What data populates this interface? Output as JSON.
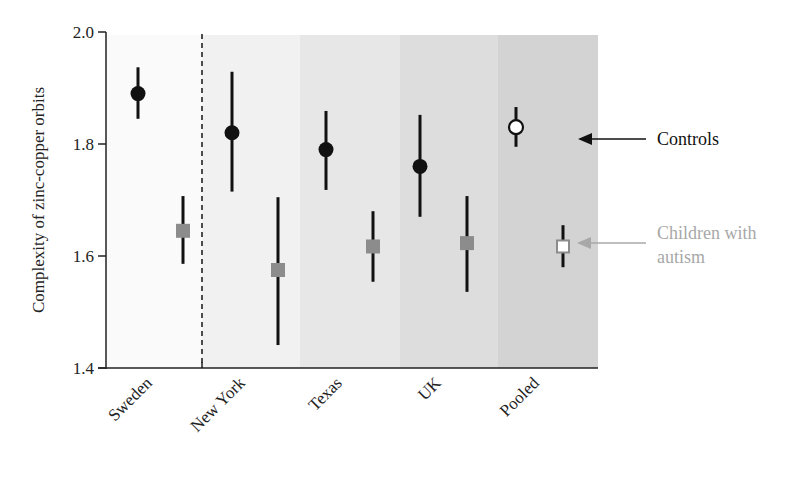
{
  "chart_data": {
    "type": "scatter",
    "subtype": "point-with-error-bars",
    "title": "",
    "xlabel": "",
    "ylabel": "Complexity of zinc-copper orbits",
    "ylim": [
      1.4,
      2.0
    ],
    "yticks": [
      "1.4",
      "1.6",
      "1.8",
      "2.0"
    ],
    "categories": [
      "Sweden",
      "New York",
      "Texas",
      "UK",
      "Pooled"
    ],
    "band_colors": [
      "#fafafa",
      "#f1f1f1",
      "#e7e7e7",
      "#dddddd",
      "#d3d3d3"
    ],
    "separator": {
      "after": "Sweden",
      "style": "dashed"
    },
    "series": [
      {
        "name": "Controls",
        "marker": "circle",
        "color": "#111111",
        "pooled_marker": "open-circle",
        "values": [
          1.89,
          1.82,
          1.79,
          1.76,
          1.83
        ],
        "lower": [
          1.845,
          1.715,
          1.718,
          1.67,
          1.795
        ],
        "upper": [
          1.937,
          1.929,
          1.859,
          1.852,
          1.866
        ]
      },
      {
        "name": "Children with autism",
        "marker": "square",
        "color": "#8c8c8c",
        "pooled_marker": "open-square",
        "values": [
          1.645,
          1.575,
          1.617,
          1.623,
          1.617
        ],
        "lower": [
          1.586,
          1.441,
          1.554,
          1.536,
          1.58
        ],
        "upper": [
          1.707,
          1.705,
          1.68,
          1.707,
          1.655
        ]
      }
    ],
    "legend": {
      "position": "right",
      "entries": [
        {
          "label": "Controls",
          "color": "#111111"
        },
        {
          "label_line1": "Children with",
          "label_line2": "autism",
          "color": "#a8a8a8"
        }
      ]
    },
    "grid": false
  }
}
